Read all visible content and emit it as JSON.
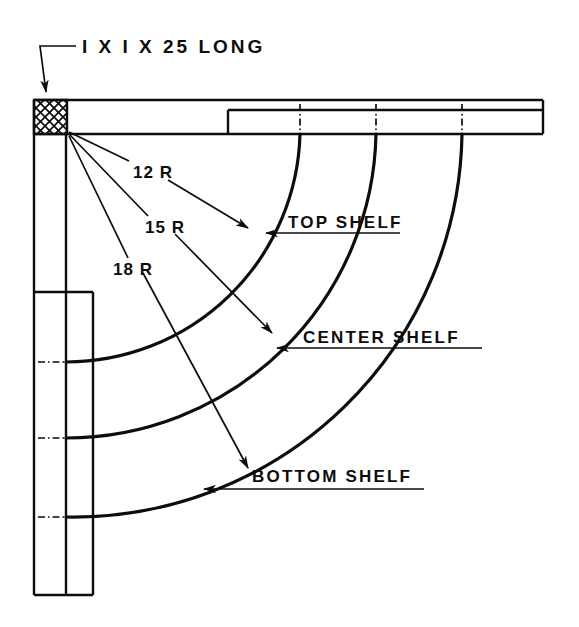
{
  "drawing": {
    "background_color": "#ffffff",
    "line_color": "#0d0d0d",
    "title_note": {
      "label": "I X I X 25 LONG",
      "name": "corner-post-callout"
    },
    "radius_callouts": [
      {
        "label": "12 R",
        "name": "radius-12",
        "radius_in": 12
      },
      {
        "label": "15 R",
        "name": "radius-15",
        "radius_in": 15
      },
      {
        "label": "18 R",
        "name": "radius-18",
        "radius_in": 18
      }
    ],
    "shelf_labels": [
      {
        "label": "TOP SHELF",
        "name": "top-shelf"
      },
      {
        "label": "CENTER SHELF",
        "name": "center-shelf"
      },
      {
        "label": "BOTTOM SHELF",
        "name": "bottom-shelf"
      }
    ],
    "parts": {
      "corner_block": "hatched-corner-post",
      "top_band": "top-horizontal-rail",
      "left_post": "left-vertical-rail"
    }
  }
}
